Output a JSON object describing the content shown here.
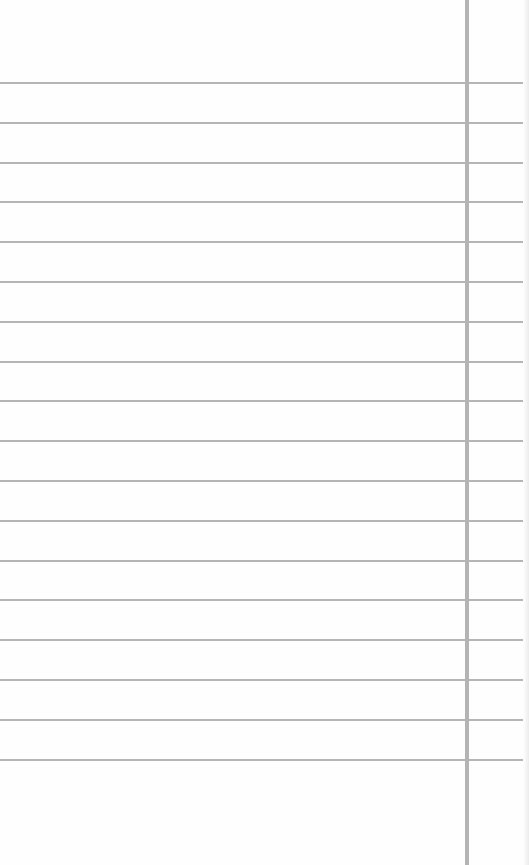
{
  "paper": {
    "type": "lined-notepaper",
    "background_color": "#fefefe",
    "rule_color": "#a8a8a8",
    "margin_color": "#b4b4b4",
    "margin_x": 465,
    "first_rule_y": 82,
    "rule_spacing": 39.8,
    "rule_count": 18
  }
}
